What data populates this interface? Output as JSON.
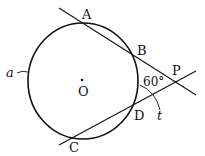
{
  "diagram": {
    "points": {
      "A": "A",
      "B": "B",
      "C": "C",
      "D": "D",
      "P": "P",
      "O": "O"
    },
    "arc_labels": {
      "a": "a",
      "t": "t"
    },
    "angle_label": "60°",
    "colors": {
      "stroke": "#111111",
      "background": "#ffffff"
    }
  }
}
